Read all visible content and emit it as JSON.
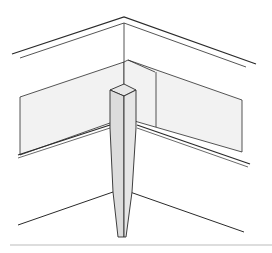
{
  "figure": {
    "type": "technical-illustration",
    "colors": {
      "line": "#2a2a2a",
      "panel_fill": "#f2f2f2",
      "post_fill": "#dcdcdc",
      "post_top": "#e8e8e8",
      "rule": "#bbbbbb",
      "background": "#ffffff"
    }
  }
}
